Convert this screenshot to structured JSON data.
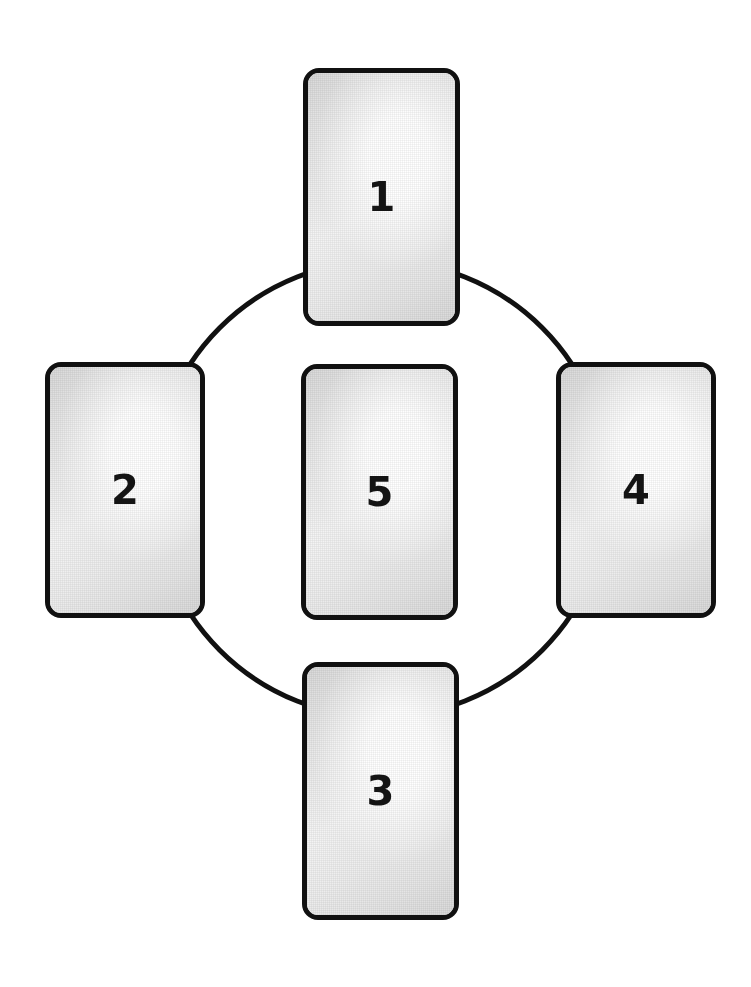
{
  "figure": {
    "name": "five-card-cycle-diagram",
    "background_color": "#ffffff",
    "width": 751,
    "height": 987
  },
  "ring": {
    "shape": "circle",
    "center_x": 381,
    "center_y": 489,
    "radius": 228,
    "stroke_color": "#111111",
    "stroke_width": 5,
    "fill": "none",
    "behind_cards": true
  },
  "cards": [
    {
      "id": "card-1",
      "label": "1",
      "position": "top",
      "x": 303,
      "y": 68,
      "width": 157,
      "height": 258,
      "radius": 16,
      "border_width": 5,
      "border_color": "#111111",
      "font_size": 40
    },
    {
      "id": "card-2",
      "label": "2",
      "position": "left",
      "x": 45,
      "y": 362,
      "width": 160,
      "height": 256,
      "radius": 16,
      "border_width": 5,
      "border_color": "#111111",
      "font_size": 40
    },
    {
      "id": "card-5",
      "label": "5",
      "position": "center",
      "x": 301,
      "y": 364,
      "width": 157,
      "height": 256,
      "radius": 16,
      "border_width": 5,
      "border_color": "#111111",
      "font_size": 40
    },
    {
      "id": "card-4",
      "label": "4",
      "position": "right",
      "x": 556,
      "y": 362,
      "width": 160,
      "height": 256,
      "radius": 16,
      "border_width": 5,
      "border_color": "#111111",
      "font_size": 40
    },
    {
      "id": "card-3",
      "label": "3",
      "position": "bottom",
      "x": 302,
      "y": 662,
      "width": 157,
      "height": 258,
      "radius": 16,
      "border_width": 5,
      "border_color": "#111111",
      "font_size": 40
    }
  ]
}
